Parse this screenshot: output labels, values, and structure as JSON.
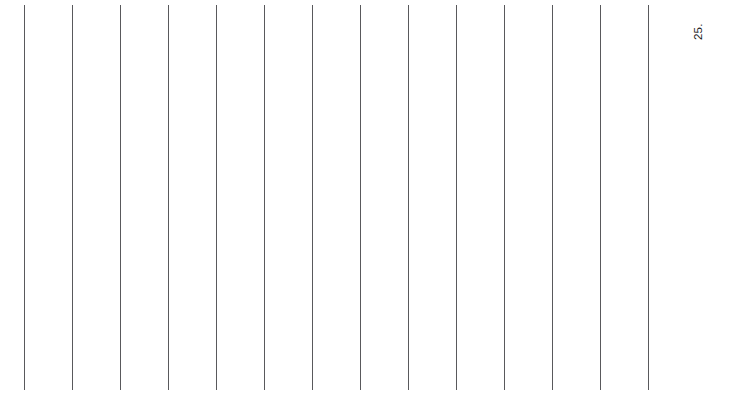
{
  "chart_data": {
    "type": "line",
    "title": "",
    "subtitle": "",
    "xlabel": "",
    "ylabel": "",
    "grid": {
      "vertical": true,
      "horizontal": false,
      "vertical_count": 14,
      "vertical_positions": [
        24,
        72,
        120,
        168,
        216,
        264,
        312,
        360,
        408,
        456,
        504,
        552,
        600,
        648
      ],
      "spacing_px": 48,
      "color": "#59595c",
      "line_width_px": 1,
      "top_px": 5,
      "bottom_px": 390
    },
    "series": [],
    "categories": [],
    "values": [],
    "annotations": [
      {
        "text": "25.",
        "rotation_deg": -90,
        "x": 693,
        "y": 40,
        "color": "#1a1a1a",
        "font_size_px": 11.5,
        "role": "axis-tick-label",
        "clipped": true
      }
    ],
    "legend": {
      "visible": false,
      "position": "none",
      "entries": []
    },
    "axis": {
      "x_range": [
        null,
        null
      ],
      "y_range": [
        null,
        null
      ],
      "x_ticks": [],
      "y_ticks": [
        "25."
      ]
    },
    "background_color": "#ffffff"
  },
  "canvas": {
    "width": 743,
    "height": 396,
    "background": "#ffffff"
  }
}
